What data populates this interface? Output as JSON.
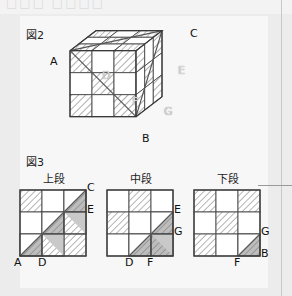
{
  "page": {
    "background": "#ececed",
    "panel_background": "#f7f7f7",
    "ghost_header": "□□□ □□□□"
  },
  "figure2": {
    "label": "図2",
    "description": "isometric 3x3x3 cube with hatched checker faces and a cut plane",
    "vertex_labels": [
      {
        "id": "A",
        "text": "A",
        "x": 50,
        "y": 62,
        "style": "dark"
      },
      {
        "id": "B",
        "text": "B",
        "x": 155,
        "y": 139,
        "style": "dark"
      },
      {
        "id": "C",
        "text": "C",
        "x": 196,
        "y": 36,
        "style": "dark"
      },
      {
        "id": "D",
        "text": "D",
        "x": 104,
        "y": 77,
        "style": "light"
      },
      {
        "id": "E",
        "text": "E",
        "x": 180,
        "y": 73,
        "style": "light"
      },
      {
        "id": "F",
        "text": "F",
        "x": 134,
        "y": 103,
        "style": "light"
      },
      {
        "id": "G",
        "text": "G",
        "x": 166,
        "y": 112,
        "style": "light"
      }
    ]
  },
  "figure3": {
    "label": "図3",
    "tiers": [
      {
        "id": "upper",
        "title": "上段",
        "hatched_cells": [
          [
            0,
            0
          ],
          [
            0,
            2
          ],
          [
            1,
            1
          ],
          [
            1,
            2
          ],
          [
            2,
            0
          ],
          [
            2,
            1
          ],
          [
            2,
            2
          ]
        ],
        "cut_cells": [
          [
            0,
            2
          ],
          [
            1,
            1
          ],
          [
            2,
            0
          ]
        ],
        "cut_halves": [
          [
            1,
            2
          ],
          [
            2,
            1
          ]
        ],
        "labels": [
          {
            "text": "C",
            "pos": "top-right-outside"
          },
          {
            "text": "E",
            "pos": "right-third"
          },
          {
            "text": "A",
            "pos": "bottom-left-outside"
          },
          {
            "text": "D",
            "pos": "bottom-third"
          }
        ]
      },
      {
        "id": "middle",
        "title": "中段",
        "hatched_cells": [
          [
            0,
            1
          ],
          [
            1,
            0
          ],
          [
            1,
            2
          ],
          [
            2,
            1
          ],
          [
            2,
            2
          ]
        ],
        "cut_cells": [
          [
            1,
            2
          ],
          [
            2,
            1
          ]
        ],
        "cut_halves": [
          [
            2,
            2
          ]
        ],
        "labels": [
          {
            "text": "E",
            "pos": "right-top-outside"
          },
          {
            "text": "G",
            "pos": "right-third"
          },
          {
            "text": "D",
            "pos": "bottom-second"
          },
          {
            "text": "F",
            "pos": "bottom-third"
          }
        ]
      },
      {
        "id": "lower",
        "title": "下段",
        "hatched_cells": [
          [
            0,
            0
          ],
          [
            0,
            2
          ],
          [
            1,
            1
          ],
          [
            2,
            0
          ],
          [
            2,
            2
          ]
        ],
        "cut_cells": [
          [
            2,
            2
          ]
        ],
        "cut_halves": [],
        "labels": [
          {
            "text": "G",
            "pos": "right-third"
          },
          {
            "text": "B",
            "pos": "bottom-right-outside"
          },
          {
            "text": "F",
            "pos": "bottom-third"
          }
        ]
      }
    ]
  },
  "colors": {
    "line": "#4a4a4a",
    "hatch": "#9a9a9a",
    "cut_fill": "#b0b0b0",
    "cell_fill": "#ffffff",
    "rule": "#c9c9c9"
  }
}
